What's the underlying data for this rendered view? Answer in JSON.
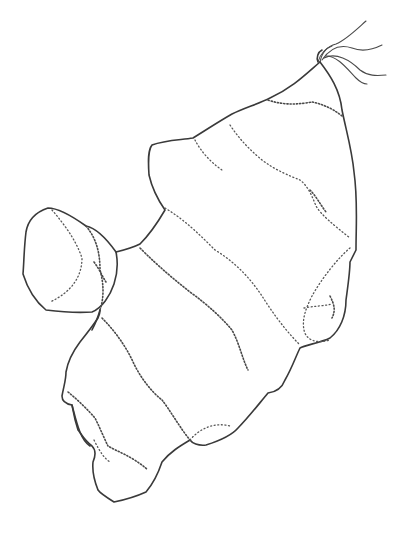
{
  "image": {
    "subject": "line drawing of a ginger rhizome",
    "style": "black ink outline with stippled ring bands",
    "background_color": "#ffffff",
    "ink_color": "#3a3a3a"
  }
}
